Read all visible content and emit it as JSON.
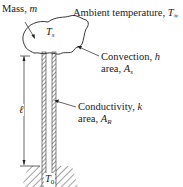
{
  "labels": {
    "mass": "Mass, ",
    "mass_var": "m",
    "ambient": "Ambient temperature, ",
    "ambient_var": "T",
    "ambient_sub": "∞",
    "surface_var": "T",
    "surface_sub": "s",
    "convection_line1": "Convection, ",
    "convection_var": "h",
    "convection_line2": "area, ",
    "convection_area_var": "A",
    "convection_area_sub": "s",
    "conductivity_line1": "Conductivity, ",
    "conductivity_var": "k",
    "conductivity_line2": "area, ",
    "conductivity_area_var": "A",
    "conductivity_area_sub": "R",
    "length_var": "ℓ",
    "base_var": "T",
    "base_sub": "0"
  },
  "colors": {
    "ink": "#1a1a1a",
    "background": "#ffffff"
  }
}
